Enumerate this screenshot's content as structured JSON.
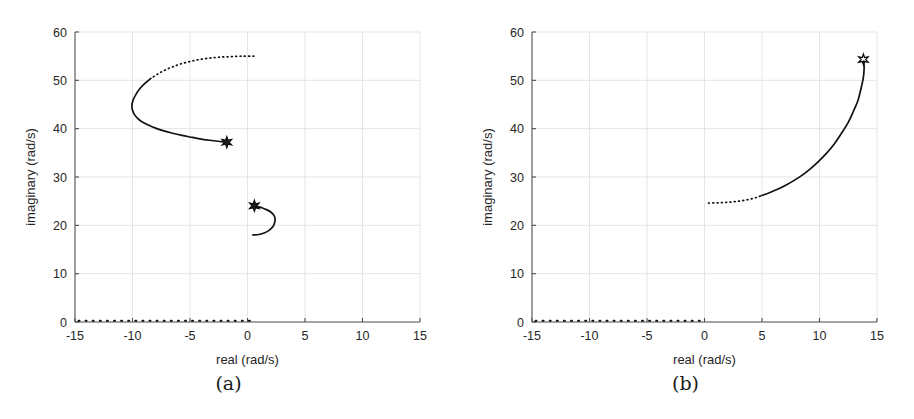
{
  "figure": {
    "panels": [
      {
        "id": "a",
        "caption": "(a)",
        "chart_data": {
          "type": "scatter",
          "title": "",
          "xlabel": "real (rad/s)",
          "ylabel": "imaginary (rad/s)",
          "xlim": [
            -15,
            15
          ],
          "ylim": [
            0,
            60
          ],
          "xticks": [
            -15,
            -10,
            -5,
            0,
            5,
            10,
            15
          ],
          "xtick_labels": [
            "-15",
            "-10",
            "-5",
            "0",
            "5",
            "10",
            "15"
          ],
          "yticks": [
            0,
            10,
            20,
            30,
            40,
            50,
            60
          ],
          "ytick_labels": [
            "0",
            "10",
            "20",
            "30",
            "40",
            "50",
            "60"
          ],
          "grid": true,
          "legend": "none",
          "series": [
            {
              "name": "upper-branch-dotted",
              "style": "dotted",
              "points": [
                [
                  0.55,
                  55.0
                ],
                [
                  -0.4,
                  55.0
                ],
                [
                  -1.4,
                  54.9
                ],
                [
                  -2.4,
                  54.8
                ],
                [
                  -3.3,
                  54.6
                ],
                [
                  -4.2,
                  54.3
                ],
                [
                  -5.0,
                  53.9
                ],
                [
                  -5.8,
                  53.4
                ],
                [
                  -6.5,
                  52.8
                ],
                [
                  -7.2,
                  52.1
                ],
                [
                  -7.8,
                  51.3
                ],
                [
                  -8.4,
                  50.4
                ]
              ]
            },
            {
              "name": "upper-branch-solid",
              "style": "solid",
              "points": [
                [
                  -8.4,
                  50.4
                ],
                [
                  -8.9,
                  49.4
                ],
                [
                  -9.35,
                  48.3
                ],
                [
                  -9.7,
                  47.1
                ],
                [
                  -9.95,
                  45.9
                ],
                [
                  -10.05,
                  44.8
                ],
                [
                  -10.0,
                  43.8
                ],
                [
                  -9.8,
                  42.8
                ],
                [
                  -9.45,
                  41.9
                ],
                [
                  -8.95,
                  41.1
                ],
                [
                  -8.3,
                  40.4
                ],
                [
                  -7.5,
                  39.7
                ],
                [
                  -6.6,
                  39.1
                ],
                [
                  -5.7,
                  38.6
                ],
                [
                  -4.8,
                  38.2
                ],
                [
                  -3.9,
                  37.8
                ],
                [
                  -3.1,
                  37.55
                ],
                [
                  -2.4,
                  37.35
                ],
                [
                  -1.85,
                  37.2
                ]
              ]
            },
            {
              "name": "lower-branch-solid",
              "style": "solid",
              "points": [
                [
                  0.45,
                  18.0
                ],
                [
                  1.0,
                  18.1
                ],
                [
                  1.5,
                  18.45
                ],
                [
                  1.9,
                  19.0
                ],
                [
                  2.2,
                  19.7
                ],
                [
                  2.35,
                  20.5
                ],
                [
                  2.4,
                  21.3
                ],
                [
                  2.3,
                  22.05
                ],
                [
                  2.05,
                  22.7
                ],
                [
                  1.7,
                  23.2
                ],
                [
                  1.3,
                  23.6
                ],
                [
                  0.9,
                  23.85
                ],
                [
                  0.62,
                  23.98
                ]
              ]
            }
          ],
          "markers": [
            {
              "name": "closed-loop-pole-upper",
              "symbol": "star-filled",
              "x": -1.8,
              "y": 37.2
            },
            {
              "name": "closed-loop-pole-lower",
              "symbol": "star-filled",
              "x": 0.6,
              "y": 24.05
            }
          ],
          "axis_dotted_track": {
            "name": "real-axis-locus",
            "y": 0,
            "x_start": -14.7,
            "x_end": 0.6
          }
        }
      },
      {
        "id": "b",
        "caption": "(b)",
        "chart_data": {
          "type": "scatter",
          "title": "",
          "xlabel": "real (rad/s)",
          "ylabel": "imaginary (rad/s)",
          "xlim": [
            -15,
            15
          ],
          "ylim": [
            0,
            60
          ],
          "xticks": [
            -15,
            -10,
            -5,
            0,
            5,
            10,
            15
          ],
          "xtick_labels": [
            "-15",
            "-10",
            "-5",
            "0",
            "5",
            "10",
            "15"
          ],
          "yticks": [
            0,
            10,
            20,
            30,
            40,
            50,
            60
          ],
          "ytick_labels": [
            "0",
            "10",
            "20",
            "30",
            "40",
            "50",
            "60"
          ],
          "grid": true,
          "legend": "none",
          "series": [
            {
              "name": "branch-dotted",
              "style": "dotted",
              "points": [
                [
                  0.35,
                  24.6
                ],
                [
                  1.0,
                  24.65
                ],
                [
                  1.6,
                  24.7
                ],
                [
                  2.2,
                  24.8
                ],
                [
                  2.8,
                  24.95
                ],
                [
                  3.4,
                  25.15
                ],
                [
                  4.0,
                  25.45
                ],
                [
                  4.55,
                  25.8
                ],
                [
                  5.0,
                  26.2
                ]
              ]
            },
            {
              "name": "branch-solid",
              "style": "solid",
              "points": [
                [
                  5.0,
                  26.2
                ],
                [
                  5.7,
                  26.8
                ],
                [
                  6.4,
                  27.5
                ],
                [
                  7.1,
                  28.35
                ],
                [
                  7.8,
                  29.3
                ],
                [
                  8.5,
                  30.4
                ],
                [
                  9.2,
                  31.7
                ],
                [
                  9.9,
                  33.2
                ],
                [
                  10.6,
                  34.9
                ],
                [
                  11.3,
                  36.9
                ],
                [
                  11.9,
                  39.0
                ],
                [
                  12.5,
                  41.3
                ],
                [
                  12.95,
                  43.6
                ],
                [
                  13.35,
                  45.9
                ],
                [
                  13.6,
                  48.2
                ],
                [
                  13.8,
                  50.4
                ],
                [
                  13.88,
                  52.4
                ],
                [
                  13.85,
                  54.0
                ]
              ]
            }
          ],
          "markers": [
            {
              "name": "closed-loop-pole",
              "symbol": "star-open",
              "x": 13.82,
              "y": 54.3
            }
          ],
          "axis_dotted_track": {
            "name": "real-axis-locus",
            "y": 0,
            "x_start": -14.7,
            "x_end": -0.2
          }
        }
      }
    ]
  }
}
